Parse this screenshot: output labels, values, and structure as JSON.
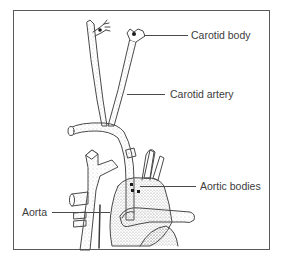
{
  "figure": {
    "labels": [
      {
        "id": "carotid-body",
        "text": "Carotid body"
      },
      {
        "id": "carotid-artery",
        "text": "Carotid artery"
      },
      {
        "id": "aortic-bodies",
        "text": "Aortic bodies"
      },
      {
        "id": "aorta",
        "text": "Aorta"
      }
    ]
  },
  "colors": {
    "line": "#4a4a4a",
    "frame": "#5a5a5a",
    "stipple": "#8a8a8a",
    "text": "#3c3c3c",
    "dot": "#1a1a1a"
  }
}
